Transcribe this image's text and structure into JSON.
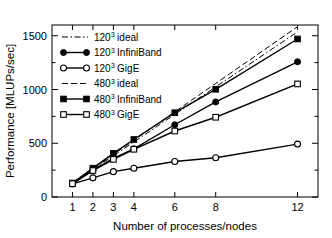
{
  "chart_data": {
    "type": "line",
    "title": "",
    "xlabel": "Number of processes/nodes",
    "ylabel": "Performance [MLUPs/sec]",
    "xlim": [
      0,
      13
    ],
    "ylim": [
      0,
      1600
    ],
    "xticks": [
      1,
      2,
      3,
      4,
      6,
      8,
      12
    ],
    "xtick_labels": [
      "1",
      "2",
      "3",
      "4",
      "6",
      "8",
      "12"
    ],
    "yticks": [
      0,
      500,
      1000,
      1500
    ],
    "ytick_labels": [
      "0",
      "500",
      "1000",
      "1500"
    ],
    "yminor": [
      250,
      750,
      1250
    ],
    "grid": false,
    "legend_position": "upper-left",
    "x": [
      1,
      2,
      3,
      4,
      6,
      8,
      12
    ],
    "series": [
      {
        "name": "120^3 ideal",
        "base": "120",
        "exponent": "3",
        "suffix": "ideal",
        "marker": "none",
        "dash": "dashdot",
        "color": "#000000",
        "values": [
          128,
          256,
          384,
          512,
          768,
          1024,
          1536
        ]
      },
      {
        "name": "120^3 InfiniBand",
        "base": "120",
        "exponent": "3",
        "suffix": "InfiniBand",
        "marker": "filled-circle",
        "dash": "solid",
        "color": "#000000",
        "values": [
          125,
          250,
          360,
          448,
          672,
          884,
          1258
        ]
      },
      {
        "name": "120^3 GigE",
        "base": "120",
        "exponent": "3",
        "suffix": "GigE",
        "marker": "open-circle",
        "dash": "solid",
        "color": "#000000",
        "values": [
          122,
          178,
          236,
          268,
          330,
          365,
          492
        ]
      },
      {
        "name": "480^3 ideal",
        "base": "480",
        "exponent": "3",
        "suffix": "ideal",
        "marker": "none",
        "dash": "dashed",
        "color": "#000000",
        "values": [
          132,
          264,
          396,
          528,
          792,
          1056,
          1584
        ]
      },
      {
        "name": "480^3 InfiniBand",
        "base": "480",
        "exponent": "3",
        "suffix": "InfiniBand",
        "marker": "filled-square",
        "dash": "solid",
        "color": "#000000",
        "values": [
          130,
          268,
          406,
          535,
          784,
          1002,
          1470
        ]
      },
      {
        "name": "480^3 GigE",
        "base": "480",
        "exponent": "3",
        "suffix": "GigE",
        "marker": "open-square",
        "dash": "solid",
        "color": "#000000",
        "values": [
          124,
          246,
          350,
          444,
          614,
          742,
          1052
        ]
      }
    ]
  },
  "axes": {
    "x_title": "Number of processes/nodes",
    "y_title": "Performance [MLUPs/sec]"
  }
}
